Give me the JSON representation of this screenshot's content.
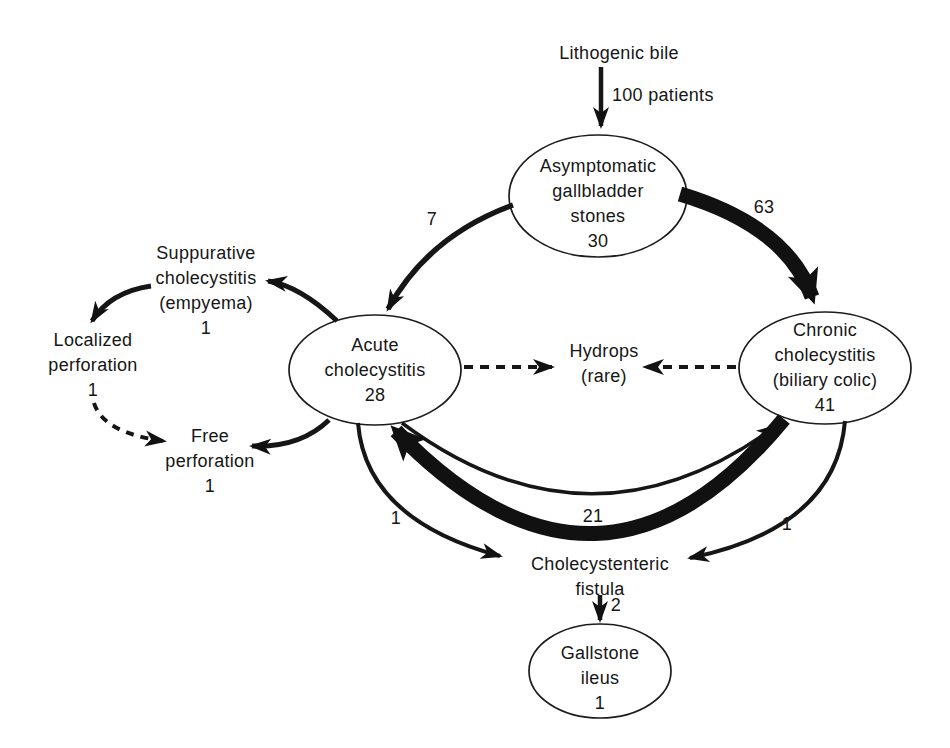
{
  "style": {
    "ink_color": "#161616",
    "background": "#ffffff"
  },
  "source_label": "Lithogenic bile",
  "nodes": {
    "asymptomatic": {
      "lines": [
        "Asymptomatic",
        "gallbladder",
        "stones"
      ],
      "count": "30"
    },
    "acute": {
      "lines": [
        "Acute",
        "cholecystitis"
      ],
      "count": "28"
    },
    "chronic": {
      "lines": [
        "Chronic",
        "cholecystitis",
        "(biliary colic)"
      ],
      "count": "41"
    },
    "suppurative": {
      "lines": [
        "Suppurative",
        "cholecystitis",
        "(empyema)"
      ],
      "count": "1"
    },
    "localized_perforation": {
      "lines": [
        "Localized",
        "perforation"
      ],
      "count": "1"
    },
    "free_perforation": {
      "lines": [
        "Free",
        "perforation"
      ],
      "count": "1"
    },
    "hydrops": {
      "lines": [
        "Hydrops",
        "(rare)"
      ]
    },
    "fistula": {
      "lines": [
        "Cholecystenteric",
        "fistula"
      ]
    },
    "gallstone_ileus": {
      "lines": [
        "Gallstone",
        "ileus"
      ],
      "count": "1"
    }
  },
  "edges": {
    "inflow": {
      "label": "100 patients"
    },
    "asymptomatic_to_acute": {
      "label": "7"
    },
    "asymptomatic_to_chronic": {
      "label": "63"
    },
    "chronic_to_acute": {
      "label": "21"
    },
    "acute_to_fistula": {
      "label": "1"
    },
    "chronic_to_fistula": {
      "label": "1"
    },
    "fistula_to_ileus": {
      "label": "2"
    }
  }
}
